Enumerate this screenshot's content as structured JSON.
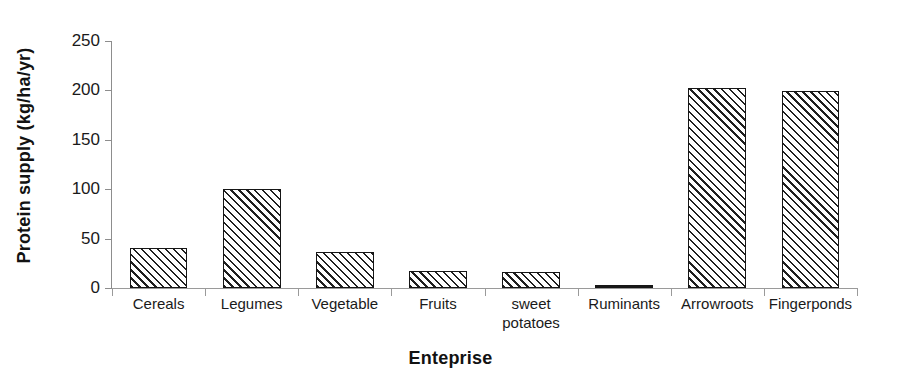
{
  "chart_data": {
    "type": "bar",
    "title": "",
    "xlabel": "Enteprise",
    "ylabel": "Protein supply (kg/ha/yr)",
    "categories": [
      "Cereals",
      "Legumes",
      "Vegetable",
      "Fruits",
      "sweet potatoes",
      "Ruminants",
      "Arrowroots",
      "Fingerponds"
    ],
    "values": [
      40,
      100,
      36,
      17,
      16,
      2,
      202,
      199
    ],
    "ylim": [
      0,
      250
    ],
    "yticks": [
      0,
      50,
      100,
      150,
      200,
      250
    ],
    "ytick_labels": [
      "0",
      "50",
      "100",
      "150",
      "200",
      "250"
    ],
    "grid": false,
    "legend": null,
    "bar_style": "diagonal-hatch-outline",
    "colors": {
      "bar_fill": "#ffffff",
      "bar_hatch": "#202020",
      "bar_edge": "#161616",
      "axis": "#8d8d8d",
      "text": "#1a1a1a",
      "background": "#ffffff"
    }
  }
}
